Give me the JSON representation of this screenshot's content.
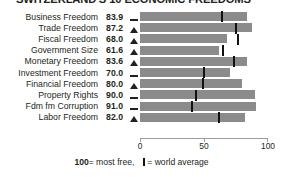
{
  "title": "SWITZERLAND'S 10 ECONOMIC FREEDOMS",
  "footer": {
    "most_free_number": "100",
    "most_free_text": " = most free,",
    "legend_tick_name": "world-average-tick",
    "legend_text": "= world average"
  },
  "axis": {
    "ticks": [
      "0",
      "50",
      "100"
    ],
    "min": 0,
    "max": 100
  },
  "chart_data": {
    "type": "bar",
    "title": "SWITZERLAND'S 10 ECONOMIC FREEDOMS",
    "xlabel": "",
    "ylabel": "",
    "xlim": [
      0,
      100
    ],
    "grid": false,
    "orientation": "horizontal",
    "legend": "100 = most free, | = world average",
    "categories": [
      "Business Freedom",
      "Trade Freedom",
      "Fiscal Freedom",
      "Government Size",
      "Monetary Freedom",
      "Investment Freedom",
      "Financial Freedom",
      "Property Rights",
      "Fdm fm Corruption",
      "Labor Freedom"
    ],
    "values": [
      83.9,
      87.2,
      68.0,
      61.6,
      83.6,
      70.0,
      80.0,
      90.0,
      91.0,
      82.0
    ],
    "world_average": [
      64.3,
      74.8,
      76.3,
      65.0,
      73.4,
      50.2,
      49.0,
      43.8,
      40.5,
      61.5
    ],
    "trend_markers": [
      "flat",
      "up",
      "up",
      "up",
      "up",
      "flat",
      "up",
      "flat",
      "flat",
      "up"
    ],
    "series": [
      {
        "name": "Switzerland score",
        "values": [
          83.9,
          87.2,
          68.0,
          61.6,
          83.6,
          70.0,
          80.0,
          90.0,
          91.0,
          82.0
        ]
      },
      {
        "name": "World average",
        "values": [
          64.3,
          74.8,
          76.3,
          65.0,
          73.4,
          50.2,
          49.0,
          43.8,
          40.5,
          61.5
        ]
      }
    ],
    "bar_color": "#8b8b8b",
    "average_marker_color": "#111111"
  },
  "rows": [
    {
      "label": "Business Freedom",
      "value": "83.9",
      "value_num": 83.9,
      "marker": "flat",
      "avg": 64.3
    },
    {
      "label": "Trade Freedom",
      "value": "87.2",
      "value_num": 87.2,
      "marker": "up",
      "avg": 74.8
    },
    {
      "label": "Fiscal Freedom",
      "value": "68.0",
      "value_num": 68.0,
      "marker": "up",
      "avg": 76.3
    },
    {
      "label": "Government Size",
      "value": "61.6",
      "value_num": 61.6,
      "marker": "up",
      "avg": 65.0
    },
    {
      "label": "Monetary Freedom",
      "value": "83.6",
      "value_num": 83.6,
      "marker": "up",
      "avg": 73.4
    },
    {
      "label": "Investment Freedom",
      "value": "70.0",
      "value_num": 70.0,
      "marker": "flat",
      "avg": 50.2
    },
    {
      "label": "Financial Freedom",
      "value": "80.0",
      "value_num": 80.0,
      "marker": "up",
      "avg": 49.0
    },
    {
      "label": "Property Rights",
      "value": "90.0",
      "value_num": 90.0,
      "marker": "flat",
      "avg": 43.8
    },
    {
      "label": "Fdm fm Corruption",
      "value": "91.0",
      "value_num": 91.0,
      "marker": "flat",
      "avg": 40.5
    },
    {
      "label": "Labor Freedom",
      "value": "82.0",
      "value_num": 82.0,
      "marker": "up",
      "avg": 61.5
    }
  ]
}
